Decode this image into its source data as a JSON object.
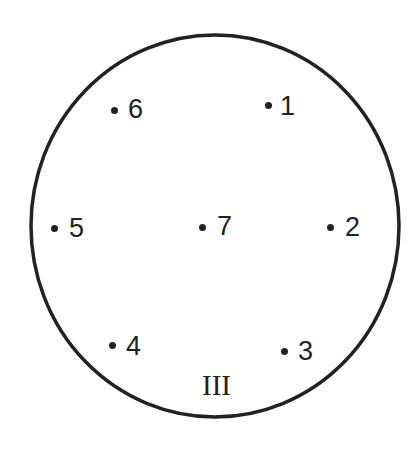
{
  "diagram": {
    "outline": {
      "shape": "circle",
      "cx": 215,
      "cy": 226,
      "rx": 184,
      "ry": 191,
      "stroke": "#222222",
      "stroke_width": 3.5
    },
    "panel_label": "III",
    "points": [
      {
        "id": "1",
        "label": "1",
        "dot_x": 268,
        "dot_y": 105
      },
      {
        "id": "2",
        "label": "2",
        "dot_x": 330,
        "dot_y": 227
      },
      {
        "id": "3",
        "label": "3",
        "dot_x": 284,
        "dot_y": 351
      },
      {
        "id": "4",
        "label": "4",
        "dot_x": 112,
        "dot_y": 345
      },
      {
        "id": "5",
        "label": "5",
        "dot_x": 54,
        "dot_y": 228
      },
      {
        "id": "6",
        "label": "6",
        "dot_x": 114,
        "dot_y": 110
      },
      {
        "id": "7",
        "label": "7",
        "dot_x": 202,
        "dot_y": 227
      }
    ],
    "colors": {
      "ink": "#222222",
      "background": "#ffffff"
    }
  }
}
